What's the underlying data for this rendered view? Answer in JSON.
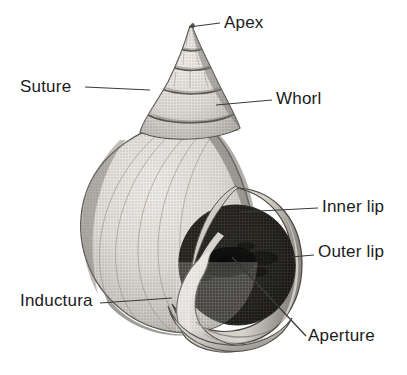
{
  "figure": {
    "background_color": "#ffffff",
    "ink_color": "#1b1b1b",
    "width": 407,
    "height": 375
  },
  "labels": [
    {
      "id": "apex",
      "text": "Apex",
      "leader": "horizontal-left"
    },
    {
      "id": "suture",
      "text": "Suture",
      "leader": "horizontal-right"
    },
    {
      "id": "whorl",
      "text": "Whorl",
      "leader": "horizontal-left"
    },
    {
      "id": "inner_lip",
      "text": "Inner lip",
      "leader": "horizontal-left"
    },
    {
      "id": "outer_lip",
      "text": "Outer lip",
      "leader": "horizontal-left"
    },
    {
      "id": "inductura",
      "text": "Inductura",
      "leader": "horizontal-right"
    },
    {
      "id": "aperture",
      "text": "Aperture",
      "leader": "diagonal-up-left"
    }
  ],
  "palette": {
    "paper": "#ffffff",
    "shell_light": "#dcdad5",
    "shell_mid": "#b6b3ac",
    "shell_shadow": "#8a877f",
    "shell_dark_edge": "#575550",
    "aperture_dark": "#3a3833",
    "aperture_core": "#141312",
    "outline": "#2a2926",
    "leader_line": "#3a3a3a"
  }
}
